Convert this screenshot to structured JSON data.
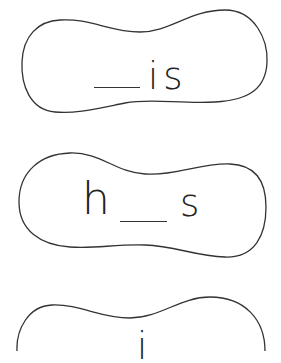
{
  "worksheet": {
    "cards": [
      {
        "parts": [
          "__",
          "i",
          "s"
        ],
        "letters": [
          "is"
        ],
        "blank_position": "start"
      },
      {
        "parts": [
          "h",
          "__",
          "s"
        ],
        "letters": [
          "h",
          "s"
        ],
        "blank_position": "middle"
      },
      {
        "parts": [
          "i"
        ],
        "letters": [
          "i"
        ],
        "blank_position": "unknown-cropped"
      }
    ]
  },
  "colors": {
    "outline": "#333333",
    "text": "#222222",
    "background": "#ffffff"
  }
}
